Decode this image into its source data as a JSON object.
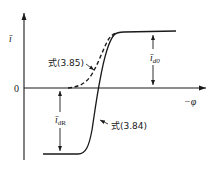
{
  "diagram": {
    "type": "characteristic-curve",
    "axes": {
      "y_axis_label": "ī",
      "x_axis_label": "−φ",
      "origin_label": "0"
    },
    "curves": [
      {
        "name": "solid-curve",
        "style": "solid",
        "label": "式(3.84)"
      },
      {
        "name": "dashed-curve",
        "style": "dashed",
        "label": "式(3.85)"
      }
    ],
    "dimensions": [
      {
        "name": "i-d0",
        "symbol": "ī",
        "subscript": "d0",
        "description": "upper saturation level above axis"
      },
      {
        "name": "i-dR",
        "symbol": "ī",
        "subscript": "dR",
        "description": "lower saturation level below axis"
      }
    ],
    "colors": {
      "ink": "#1a1a1a",
      "background": "#ffffff"
    }
  }
}
